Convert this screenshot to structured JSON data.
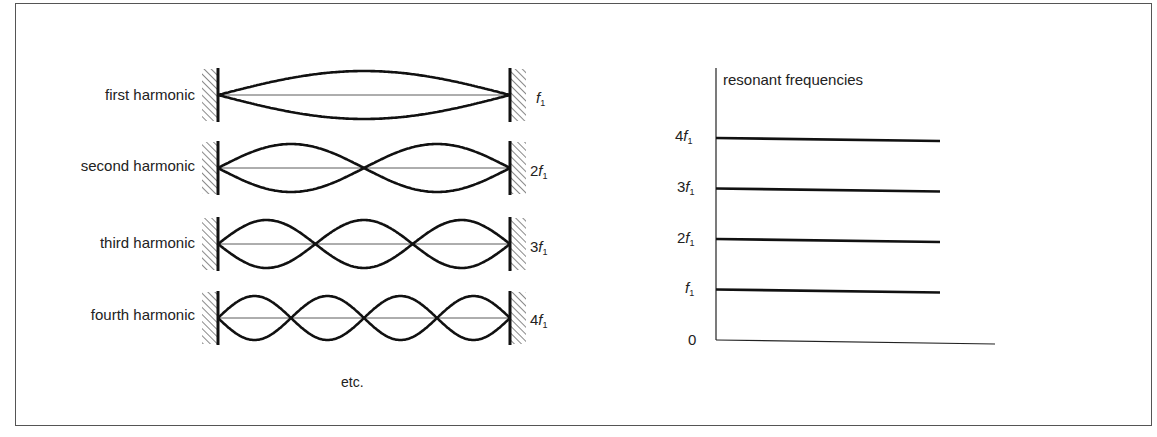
{
  "left_panel": {
    "harmonics": [
      {
        "label": "first harmonic",
        "mult": "",
        "loops": 1
      },
      {
        "label": "second harmonic",
        "mult": "2",
        "loops": 2
      },
      {
        "label": "third harmonic",
        "mult": "3",
        "loops": 3
      },
      {
        "label": "fourth harmonic",
        "mult": "4",
        "loops": 4
      }
    ],
    "freq_symbol": "f",
    "freq_sub": "1",
    "footer": "etc."
  },
  "right_panel": {
    "title": "resonant frequencies",
    "ticks": [
      {
        "mult": "4",
        "sub": "1"
      },
      {
        "mult": "3",
        "sub": "1"
      },
      {
        "mult": "2",
        "sub": "1"
      },
      {
        "mult": "",
        "sub": "1"
      }
    ],
    "zero": "0"
  },
  "chart_data": {
    "type": "bar",
    "title": "resonant frequencies",
    "categories": [
      "f1",
      "2f1",
      "3f1",
      "4f1"
    ],
    "values": [
      1,
      2,
      3,
      4
    ],
    "ylabel": "resonant frequencies",
    "ytick_labels": [
      "0",
      "f1",
      "2f1",
      "3f1",
      "4f1"
    ],
    "ylim": [
      0,
      5
    ],
    "grid": false,
    "orientation": "horizontal lines (energy-level style)"
  }
}
